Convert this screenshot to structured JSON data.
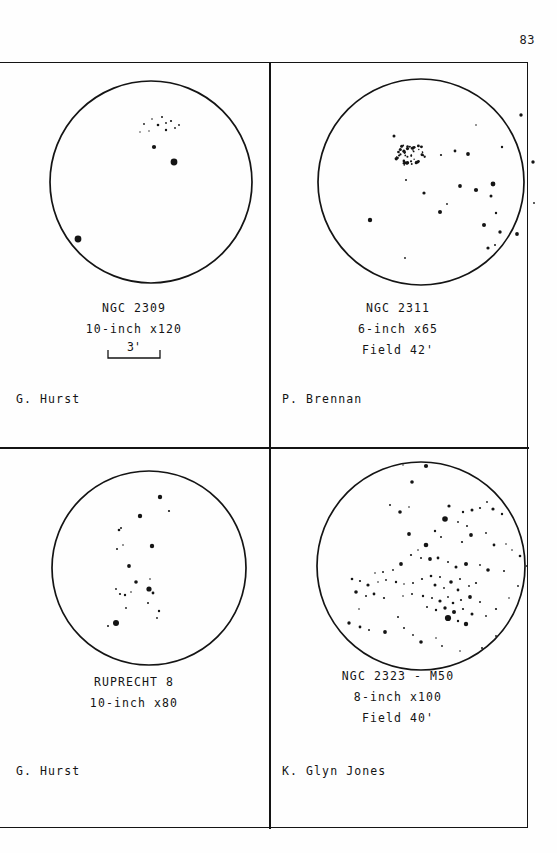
{
  "page": {
    "number": "83",
    "background": "#fefefe",
    "ink": "#141414"
  },
  "panels": [
    {
      "id": "ngc-2309",
      "object": "NGC 2309",
      "instrument": "10-inch x120",
      "field": "",
      "scale_bar": "3'",
      "observer": "G. Hurst",
      "circle": {
        "cx": 135,
        "cy": 120,
        "r": 101
      },
      "stars": [
        {
          "x": 128,
          "y": 62,
          "r": 0.9
        },
        {
          "x": 136,
          "y": 57,
          "r": 0.8
        },
        {
          "x": 146,
          "y": 55,
          "r": 1.0
        },
        {
          "x": 142,
          "y": 63,
          "r": 1.3
        },
        {
          "x": 150,
          "y": 61,
          "r": 0.9
        },
        {
          "x": 155,
          "y": 59,
          "r": 1.1
        },
        {
          "x": 150,
          "y": 68,
          "r": 1.2
        },
        {
          "x": 159,
          "y": 66,
          "r": 0.9
        },
        {
          "x": 163,
          "y": 63,
          "r": 0.9
        },
        {
          "x": 124,
          "y": 70,
          "r": 0.7
        },
        {
          "x": 133,
          "y": 69,
          "r": 0.7
        },
        {
          "x": 138,
          "y": 85,
          "r": 2.1
        },
        {
          "x": 158,
          "y": 100,
          "r": 3.4
        },
        {
          "x": 62,
          "y": 177,
          "r": 3.4
        }
      ]
    },
    {
      "id": "ngc-2311",
      "object": "NGC 2311",
      "instrument": "6-inch x65",
      "field": "Field 42'",
      "scale_bar": "",
      "observer": "P. Brennan",
      "circle": {
        "cx": 131,
        "cy": 120,
        "r": 103
      },
      "cluster_blob": {
        "cx": 120,
        "cy": 93,
        "rx": 15,
        "ry": 13,
        "count": 46
      },
      "stars": [
        {
          "x": 104,
          "y": 74,
          "r": 1.5
        },
        {
          "x": 151,
          "y": 93,
          "r": 1.1
        },
        {
          "x": 165,
          "y": 89,
          "r": 1.4
        },
        {
          "x": 178,
          "y": 92,
          "r": 1.9
        },
        {
          "x": 231,
          "y": 53,
          "r": 1.7
        },
        {
          "x": 186,
          "y": 63,
          "r": 0.8
        },
        {
          "x": 212,
          "y": 85,
          "r": 1.2
        },
        {
          "x": 243,
          "y": 100,
          "r": 1.7
        },
        {
          "x": 116,
          "y": 118,
          "r": 1.0
        },
        {
          "x": 134,
          "y": 131,
          "r": 1.6
        },
        {
          "x": 170,
          "y": 124,
          "r": 1.9
        },
        {
          "x": 186,
          "y": 128,
          "r": 2.1
        },
        {
          "x": 203,
          "y": 122,
          "r": 2.4
        },
        {
          "x": 157,
          "y": 142,
          "r": 0.9
        },
        {
          "x": 150,
          "y": 150,
          "r": 2.0
        },
        {
          "x": 201,
          "y": 134,
          "r": 1.5
        },
        {
          "x": 206,
          "y": 151,
          "r": 1.2
        },
        {
          "x": 80,
          "y": 158,
          "r": 2.2
        },
        {
          "x": 194,
          "y": 163,
          "r": 2.0
        },
        {
          "x": 210,
          "y": 170,
          "r": 1.7
        },
        {
          "x": 227,
          "y": 172,
          "r": 1.9
        },
        {
          "x": 198,
          "y": 186,
          "r": 1.6
        },
        {
          "x": 205,
          "y": 183,
          "r": 1.0
        },
        {
          "x": 115,
          "y": 196,
          "r": 0.9
        },
        {
          "x": 244,
          "y": 141,
          "r": 0.9
        }
      ]
    },
    {
      "id": "ruprecht-8",
      "object": "RUPRECHT 8",
      "instrument": "10-inch x80",
      "field": "",
      "scale_bar": "",
      "observer": "G. Hurst",
      "circle": {
        "cx": 133,
        "cy": 122,
        "r": 97
      },
      "stars": [
        {
          "x": 144,
          "y": 51,
          "r": 2.2
        },
        {
          "x": 153,
          "y": 65,
          "r": 1.1
        },
        {
          "x": 124,
          "y": 70,
          "r": 2.2
        },
        {
          "x": 136,
          "y": 100,
          "r": 2.2
        },
        {
          "x": 105,
          "y": 82,
          "r": 1.0
        },
        {
          "x": 103,
          "y": 84,
          "r": 1.3
        },
        {
          "x": 101,
          "y": 103,
          "r": 1.0
        },
        {
          "x": 107,
          "y": 99,
          "r": 0.8
        },
        {
          "x": 113,
          "y": 120,
          "r": 1.9
        },
        {
          "x": 120,
          "y": 136,
          "r": 1.8
        },
        {
          "x": 134,
          "y": 133,
          "r": 0.8
        },
        {
          "x": 100,
          "y": 143,
          "r": 0.9
        },
        {
          "x": 104,
          "y": 148,
          "r": 1.1
        },
        {
          "x": 109,
          "y": 149,
          "r": 1.2
        },
        {
          "x": 115,
          "y": 146,
          "r": 0.8
        },
        {
          "x": 133,
          "y": 143,
          "r": 2.6
        },
        {
          "x": 137,
          "y": 147,
          "r": 1.4
        },
        {
          "x": 132,
          "y": 157,
          "r": 1.0
        },
        {
          "x": 110,
          "y": 162,
          "r": 0.9
        },
        {
          "x": 143,
          "y": 165,
          "r": 1.2
        },
        {
          "x": 141,
          "y": 172,
          "r": 0.9
        },
        {
          "x": 100,
          "y": 177,
          "r": 3.0
        },
        {
          "x": 92,
          "y": 180,
          "r": 1.0
        }
      ]
    },
    {
      "id": "ngc-2323-m50",
      "object": "NGC 2323 - M50",
      "instrument": "8-inch x100",
      "field": "Field 40'",
      "scale_bar": "",
      "observer": "K. Glyn Jones",
      "circle": {
        "cx": 131,
        "cy": 120,
        "r": 104
      },
      "stars": [
        {
          "x": 113,
          "y": 19,
          "r": 0.7
        },
        {
          "x": 136,
          "y": 20,
          "r": 2.1
        },
        {
          "x": 122,
          "y": 36,
          "r": 1.8
        },
        {
          "x": 100,
          "y": 59,
          "r": 1.0
        },
        {
          "x": 110,
          "y": 66,
          "r": 1.8
        },
        {
          "x": 119,
          "y": 61,
          "r": 0.8
        },
        {
          "x": 159,
          "y": 60,
          "r": 1.6
        },
        {
          "x": 173,
          "y": 66,
          "r": 1.2
        },
        {
          "x": 182,
          "y": 64,
          "r": 1.5
        },
        {
          "x": 190,
          "y": 62,
          "r": 1.1
        },
        {
          "x": 197,
          "y": 56,
          "r": 0.9
        },
        {
          "x": 203,
          "y": 63,
          "r": 1.6
        },
        {
          "x": 212,
          "y": 68,
          "r": 1.2
        },
        {
          "x": 155,
          "y": 73,
          "r": 2.8
        },
        {
          "x": 168,
          "y": 76,
          "r": 0.9
        },
        {
          "x": 177,
          "y": 80,
          "r": 1.0
        },
        {
          "x": 119,
          "y": 88,
          "r": 1.9
        },
        {
          "x": 145,
          "y": 85,
          "r": 1.2
        },
        {
          "x": 151,
          "y": 91,
          "r": 1.0
        },
        {
          "x": 181,
          "y": 89,
          "r": 1.9
        },
        {
          "x": 196,
          "y": 87,
          "r": 0.9
        },
        {
          "x": 172,
          "y": 96,
          "r": 1.1
        },
        {
          "x": 204,
          "y": 99,
          "r": 1.4
        },
        {
          "x": 216,
          "y": 98,
          "r": 0.8
        },
        {
          "x": 136,
          "y": 99,
          "r": 2.3
        },
        {
          "x": 128,
          "y": 104,
          "r": 0.8
        },
        {
          "x": 121,
          "y": 109,
          "r": 1.1
        },
        {
          "x": 131,
          "y": 112,
          "r": 1.0
        },
        {
          "x": 140,
          "y": 113,
          "r": 1.9
        },
        {
          "x": 148,
          "y": 112,
          "r": 1.4
        },
        {
          "x": 111,
          "y": 118,
          "r": 1.9
        },
        {
          "x": 103,
          "y": 124,
          "r": 0.9
        },
        {
          "x": 93,
          "y": 126,
          "r": 1.0
        },
        {
          "x": 85,
          "y": 127,
          "r": 0.8
        },
        {
          "x": 158,
          "y": 116,
          "r": 1.0
        },
        {
          "x": 166,
          "y": 121,
          "r": 1.5
        },
        {
          "x": 176,
          "y": 118,
          "r": 2.0
        },
        {
          "x": 190,
          "y": 119,
          "r": 0.9
        },
        {
          "x": 198,
          "y": 124,
          "r": 1.8
        },
        {
          "x": 214,
          "y": 125,
          "r": 1.0
        },
        {
          "x": 62,
          "y": 133,
          "r": 1.3
        },
        {
          "x": 70,
          "y": 135,
          "r": 1.1
        },
        {
          "x": 78,
          "y": 139,
          "r": 1.6
        },
        {
          "x": 88,
          "y": 136,
          "r": 0.8
        },
        {
          "x": 96,
          "y": 134,
          "r": 0.9
        },
        {
          "x": 106,
          "y": 136,
          "r": 1.2
        },
        {
          "x": 114,
          "y": 138,
          "r": 0.8
        },
        {
          "x": 123,
          "y": 137,
          "r": 1.0
        },
        {
          "x": 132,
          "y": 133,
          "r": 1.1
        },
        {
          "x": 141,
          "y": 130,
          "r": 1.3
        },
        {
          "x": 150,
          "y": 131,
          "r": 1.0
        },
        {
          "x": 145,
          "y": 139,
          "r": 1.5
        },
        {
          "x": 154,
          "y": 142,
          "r": 0.9
        },
        {
          "x": 161,
          "y": 136,
          "r": 1.8
        },
        {
          "x": 170,
          "y": 133,
          "r": 1.0
        },
        {
          "x": 168,
          "y": 144,
          "r": 1.4
        },
        {
          "x": 179,
          "y": 140,
          "r": 0.9
        },
        {
          "x": 186,
          "y": 137,
          "r": 1.1
        },
        {
          "x": 66,
          "y": 146,
          "r": 1.8
        },
        {
          "x": 76,
          "y": 150,
          "r": 1.0
        },
        {
          "x": 84,
          "y": 148,
          "r": 1.4
        },
        {
          "x": 94,
          "y": 152,
          "r": 1.1
        },
        {
          "x": 113,
          "y": 150,
          "r": 0.8
        },
        {
          "x": 122,
          "y": 148,
          "r": 1.0
        },
        {
          "x": 133,
          "y": 150,
          "r": 1.2
        },
        {
          "x": 142,
          "y": 152,
          "r": 1.0
        },
        {
          "x": 150,
          "y": 155,
          "r": 1.6
        },
        {
          "x": 158,
          "y": 151,
          "r": 0.9
        },
        {
          "x": 163,
          "y": 157,
          "r": 1.3
        },
        {
          "x": 171,
          "y": 154,
          "r": 1.1
        },
        {
          "x": 180,
          "y": 151,
          "r": 1.9
        },
        {
          "x": 190,
          "y": 156,
          "r": 1.0
        },
        {
          "x": 137,
          "y": 161,
          "r": 1.0
        },
        {
          "x": 146,
          "y": 164,
          "r": 1.2
        },
        {
          "x": 155,
          "y": 162,
          "r": 1.7
        },
        {
          "x": 164,
          "y": 166,
          "r": 2.0
        },
        {
          "x": 173,
          "y": 163,
          "r": 1.1
        },
        {
          "x": 182,
          "y": 168,
          "r": 1.5
        },
        {
          "x": 158,
          "y": 172,
          "r": 3.1
        },
        {
          "x": 168,
          "y": 175,
          "r": 1.2
        },
        {
          "x": 176,
          "y": 178,
          "r": 2.2
        },
        {
          "x": 196,
          "y": 170,
          "r": 0.9
        },
        {
          "x": 206,
          "y": 163,
          "r": 1.1
        },
        {
          "x": 219,
          "y": 152,
          "r": 0.8
        },
        {
          "x": 228,
          "y": 140,
          "r": 0.9
        },
        {
          "x": 237,
          "y": 120,
          "r": 1.0
        },
        {
          "x": 230,
          "y": 110,
          "r": 1.3
        },
        {
          "x": 222,
          "y": 104,
          "r": 0.8
        },
        {
          "x": 69,
          "y": 163,
          "r": 0.8
        },
        {
          "x": 59,
          "y": 177,
          "r": 1.7
        },
        {
          "x": 70,
          "y": 181,
          "r": 1.4
        },
        {
          "x": 79,
          "y": 184,
          "r": 1.0
        },
        {
          "x": 95,
          "y": 186,
          "r": 1.9
        },
        {
          "x": 114,
          "y": 182,
          "r": 1.0
        },
        {
          "x": 123,
          "y": 189,
          "r": 0.9
        },
        {
          "x": 131,
          "y": 196,
          "r": 1.8
        },
        {
          "x": 146,
          "y": 192,
          "r": 0.8
        },
        {
          "x": 152,
          "y": 200,
          "r": 0.9
        },
        {
          "x": 170,
          "y": 205,
          "r": 0.8
        },
        {
          "x": 192,
          "y": 202,
          "r": 1.0
        },
        {
          "x": 206,
          "y": 190,
          "r": 0.9
        },
        {
          "x": 108,
          "y": 171,
          "r": 1.0
        }
      ]
    }
  ]
}
